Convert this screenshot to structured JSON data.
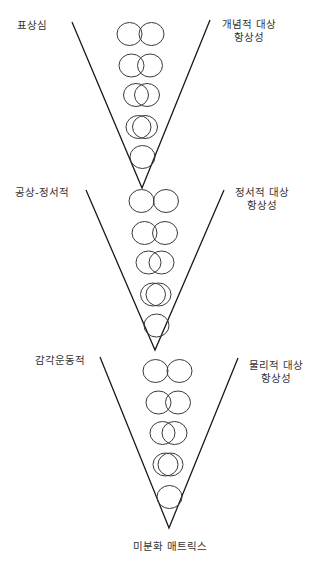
{
  "diagram": {
    "title": "",
    "colors": {
      "line": "#1a1a1a",
      "circle": "#3a3a3a",
      "text": "#333333",
      "background": "#ffffff"
    },
    "levels": [
      {
        "name": "level-representational",
        "left_label": "표상심",
        "right_label": [
          "개념적 대상",
          "항상성"
        ],
        "left_label_pos": [
          17,
          29
        ],
        "right_label_pos": [
          249,
          28
        ],
        "v_lines": {
          "left_top": [
            72,
            22
          ],
          "right_top": [
            210,
            20
          ],
          "apex": [
            142,
            188
          ]
        },
        "circle_rows": [
          {
            "cy": 34,
            "pair": [
              129.5,
              151.5
            ]
          },
          {
            "cy": 65.5,
            "pair": [
              131.5,
              150
            ]
          },
          {
            "cy": 95,
            "pair": [
              136,
              147
            ]
          },
          {
            "cy": 127,
            "pair": [
              138.5,
              145
            ]
          },
          {
            "cy": 157,
            "pair": [
              142.5
            ]
          }
        ]
      },
      {
        "name": "level-phantasmic-emotional",
        "left_label": "공상-정서적",
        "right_label": [
          "정서적 대상",
          "항상성"
        ],
        "left_label_pos": [
          15,
          196
        ],
        "right_label_pos": [
          262,
          196
        ],
        "v_lines": {
          "left_top": [
            86,
            190
          ],
          "right_top": [
            224,
            190
          ],
          "apex": [
            155,
            350
          ]
        },
        "circle_rows": [
          {
            "cy": 201,
            "pair": [
              141.5,
              166
            ]
          },
          {
            "cy": 233,
            "pair": [
              144.5,
              165
            ]
          },
          {
            "cy": 262.5,
            "pair": [
              148.5,
              161.5
            ]
          },
          {
            "cy": 294.5,
            "pair": [
              153,
              158.5
            ]
          },
          {
            "cy": 325.5,
            "pair": [
              156.5
            ]
          }
        ]
      },
      {
        "name": "level-sensorimotor",
        "left_label": "감각운동적",
        "right_label": [
          "물리적 대상",
          "항상성"
        ],
        "left_label_pos": [
          35,
          364
        ],
        "right_label_pos": [
          276,
          369
        ],
        "v_lines": {
          "left_top": [
            100,
            357
          ],
          "right_top": [
            238,
            358
          ],
          "apex": [
            169,
            528
          ]
        },
        "circle_rows": [
          {
            "cy": 371,
            "pair": [
              155.5,
              179.5
            ]
          },
          {
            "cy": 402.5,
            "pair": [
              158.5,
              178
            ]
          },
          {
            "cy": 433,
            "pair": [
              162.5,
              174.5
            ]
          },
          {
            "cy": 464.5,
            "pair": [
              165.5,
              170.5
            ]
          },
          {
            "cy": 497,
            "pair": [
              169.5
            ]
          }
        ]
      }
    ],
    "circle_radius": [
      12.5,
      11.5
    ],
    "line_height": 13,
    "bottom_label": "미분화 매트릭스",
    "bottom_label_pos": [
      170,
      550
    ]
  }
}
